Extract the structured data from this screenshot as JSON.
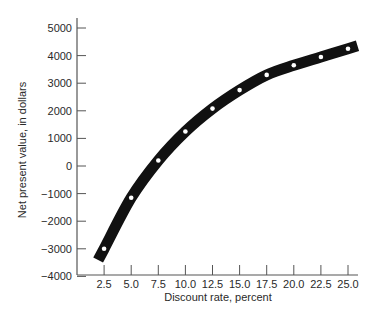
{
  "chart_data": {
    "type": "line",
    "title": "",
    "xlabel": "Discount rate, percent",
    "ylabel": "Net present value, in dollars",
    "x": [
      2.5,
      5.0,
      7.5,
      10.0,
      12.5,
      15.0,
      17.5,
      20.0,
      22.5,
      25.0
    ],
    "series": [
      {
        "name": "Net present value",
        "values": [
          -3000,
          -1150,
          200,
          1250,
          2080,
          2750,
          3300,
          3650,
          3950,
          4250
        ]
      }
    ],
    "x_ticks": [
      "2.5",
      "5.0",
      "7.5",
      "10.0",
      "12.5",
      "15.0",
      "17.5",
      "20.0",
      "22.5",
      "25.0"
    ],
    "y_ticks": [
      "5000",
      "4000",
      "3000",
      "2000",
      "1000",
      "0",
      "−1000",
      "−2000",
      "−3000",
      "−4000"
    ],
    "xlim": [
      0,
      26.5
    ],
    "ylim": [
      -4000,
      5300
    ],
    "grid": false,
    "legend": "none",
    "style": {
      "line_color": "#111111",
      "marker_color": "#ffffff",
      "axis_color": "#555555"
    }
  }
}
